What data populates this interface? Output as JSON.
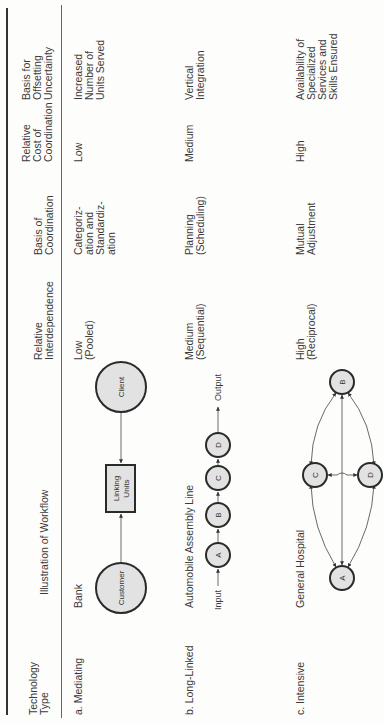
{
  "table": {
    "columns": [
      {
        "key": "technology_type",
        "label": "Technology\nType"
      },
      {
        "key": "illustration",
        "label": "Illustration of Workflow"
      },
      {
        "key": "interdependence",
        "label": "Relative\nInterdependence"
      },
      {
        "key": "basis_coordination",
        "label": "Basis of\nCoordination"
      },
      {
        "key": "cost_coordination",
        "label": "Relative\nCost of\nCoordination"
      },
      {
        "key": "offsetting",
        "label": "Basis for\nOffsetting\nUncertainty"
      }
    ],
    "rows": [
      {
        "technology_type": "a. Mediating",
        "illustration": "Bank",
        "interdependence": "Low\n(Pooled)",
        "basis_coordination": "Categoriz-\nation and\nStandardiz-\nation",
        "cost_coordination": "Low",
        "offsetting": "Increased\nNumber of\nUnits Served",
        "diagram": {
          "type": "mediating",
          "nodes": [
            "Customer",
            "Linking\nUnits",
            "Client"
          ]
        }
      },
      {
        "technology_type": "b. Long-Linked",
        "illustration": "Automobile Assembly Line",
        "interdependence": "Medium\n(Sequential)",
        "basis_coordination": "Planning\n(Scheduling)",
        "cost_coordination": "Medium",
        "offsetting": "Vertical\nIntegration",
        "diagram": {
          "type": "long-linked",
          "input_label": "Input",
          "output_label": "Output",
          "nodes": [
            "A",
            "B",
            "C",
            "D"
          ]
        }
      },
      {
        "technology_type": "c. Intensive",
        "illustration": "General Hospital",
        "interdependence": "High\n(Reciprocal)",
        "basis_coordination": "Mutual\nAdjustment",
        "cost_coordination": "High",
        "offsetting": "Availability of\nSpecialized\nServices and\nSkills Ensured",
        "diagram": {
          "type": "intensive",
          "nodes": [
            "A",
            "B",
            "C",
            "D"
          ]
        }
      }
    ]
  },
  "colors": {
    "text": "#3a3a3a",
    "rule": "#333333",
    "node_fill": "#e2e2e2",
    "node_stroke": "#2a2a2a",
    "background": "#fdfdfb"
  }
}
